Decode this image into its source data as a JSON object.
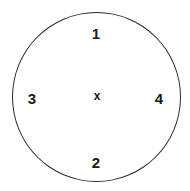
{
  "diagram": {
    "shape": "circle",
    "stroke_color": "#2a2a2a",
    "center_mark": "x",
    "positions": [
      {
        "id": "top",
        "label": "1"
      },
      {
        "id": "bottom",
        "label": "2"
      },
      {
        "id": "left",
        "label": "3"
      },
      {
        "id": "right",
        "label": "4"
      }
    ]
  }
}
